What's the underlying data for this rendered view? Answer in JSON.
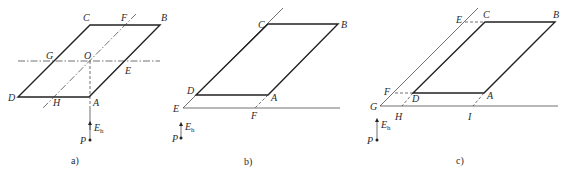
{
  "figure": {
    "panels": [
      {
        "id": "a",
        "caption": "a)",
        "points": {
          "A": "A",
          "B": "B",
          "C": "C",
          "D": "D",
          "E": "E",
          "F": "F",
          "G": "G",
          "H": "H",
          "O": "O",
          "P": "P"
        },
        "vector": {
          "symbol": "E",
          "subscript": "h"
        }
      },
      {
        "id": "b",
        "caption": "b)",
        "points": {
          "A": "A",
          "B": "B",
          "C": "C",
          "D": "D",
          "E": "E",
          "F": "F",
          "P": "P"
        },
        "vector": {
          "symbol": "E",
          "subscript": "h"
        }
      },
      {
        "id": "c",
        "caption": "c)",
        "points": {
          "A": "A",
          "B": "B",
          "C": "C",
          "D": "D",
          "E": "E",
          "F": "F",
          "G": "G",
          "H": "H",
          "I": "I",
          "P": "P"
        },
        "vector": {
          "symbol": "E",
          "subscript": "h"
        }
      }
    ]
  },
  "colors": {
    "ink": "#222222",
    "background": "#ffffff"
  }
}
